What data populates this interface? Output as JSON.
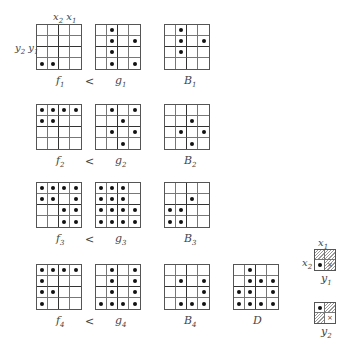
{
  "figure": {
    "axis_labels": {
      "top": "x2 x1",
      "left": "y2 y1"
    },
    "relation_symbol": "<",
    "rows": [
      {
        "f": {
          "label": "f",
          "sub": "1",
          "cells": [
            [
              0,
              0,
              0,
              0
            ],
            [
              0,
              0,
              0,
              0
            ],
            [
              0,
              0,
              0,
              0
            ],
            [
              1,
              1,
              0,
              0
            ]
          ]
        },
        "g": {
          "label": "g",
          "sub": "1",
          "cells": [
            [
              0,
              1,
              0,
              0
            ],
            [
              0,
              1,
              0,
              1
            ],
            [
              0,
              1,
              0,
              0
            ],
            [
              0,
              1,
              0,
              1
            ]
          ]
        },
        "B": {
          "label": "B",
          "sub": "1",
          "cells": [
            [
              0,
              1,
              0,
              0
            ],
            [
              0,
              1,
              0,
              1
            ],
            [
              0,
              1,
              0,
              0
            ],
            [
              0,
              0,
              0,
              0
            ]
          ]
        }
      },
      {
        "f": {
          "label": "f",
          "sub": "2",
          "cells": [
            [
              1,
              1,
              1,
              1
            ],
            [
              1,
              1,
              0,
              0
            ],
            [
              0,
              0,
              0,
              0
            ],
            [
              0,
              0,
              0,
              0
            ]
          ]
        },
        "g": {
          "label": "g",
          "sub": "2",
          "cells": [
            [
              0,
              1,
              0,
              1
            ],
            [
              0,
              0,
              1,
              0
            ],
            [
              0,
              1,
              0,
              1
            ],
            [
              0,
              0,
              1,
              0
            ]
          ]
        },
        "B": {
          "label": "B",
          "sub": "2",
          "cells": [
            [
              0,
              0,
              0,
              0
            ],
            [
              0,
              0,
              1,
              0
            ],
            [
              0,
              1,
              0,
              1
            ],
            [
              0,
              0,
              1,
              0
            ]
          ]
        }
      },
      {
        "f": {
          "label": "f",
          "sub": "3",
          "cells": [
            [
              1,
              1,
              1,
              1
            ],
            [
              1,
              1,
              0,
              1
            ],
            [
              0,
              0,
              1,
              1
            ],
            [
              0,
              0,
              1,
              1
            ]
          ]
        },
        "g": {
          "label": "g",
          "sub": "3",
          "cells": [
            [
              1,
              1,
              1,
              0
            ],
            [
              1,
              1,
              1,
              0
            ],
            [
              1,
              1,
              1,
              1
            ],
            [
              1,
              1,
              1,
              1
            ]
          ]
        },
        "B": {
          "label": "B",
          "sub": "3",
          "cells": [
            [
              0,
              0,
              0,
              0
            ],
            [
              0,
              0,
              1,
              0
            ],
            [
              1,
              1,
              0,
              0
            ],
            [
              1,
              1,
              0,
              0
            ]
          ]
        }
      },
      {
        "f": {
          "label": "f",
          "sub": "4",
          "cells": [
            [
              1,
              1,
              1,
              1
            ],
            [
              1,
              0,
              0,
              0
            ],
            [
              1,
              1,
              0,
              0
            ],
            [
              1,
              0,
              0,
              0
            ]
          ]
        },
        "g": {
          "label": "g",
          "sub": "4",
          "cells": [
            [
              0,
              1,
              0,
              1
            ],
            [
              0,
              1,
              0,
              1
            ],
            [
              0,
              1,
              0,
              1
            ],
            [
              1,
              1,
              1,
              1
            ]
          ]
        },
        "B": {
          "label": "B",
          "sub": "4",
          "cells": [
            [
              0,
              0,
              0,
              0
            ],
            [
              0,
              1,
              0,
              1
            ],
            [
              0,
              0,
              0,
              1
            ],
            [
              0,
              1,
              1,
              1
            ]
          ]
        }
      }
    ],
    "D": {
      "label": "D",
      "sub": "",
      "cells": [
        [
          0,
          1,
          0,
          0
        ],
        [
          0,
          1,
          1,
          1
        ],
        [
          1,
          1,
          0,
          1
        ],
        [
          1,
          1,
          1,
          1
        ]
      ]
    },
    "legend": [
      {
        "name": "y1",
        "top_label": "x1",
        "left_label": "x2",
        "bottom_label": "y",
        "bottom_sub": "1",
        "cells": [
          [
            "hatch",
            ""
          ],
          [
            "dot",
            "x"
          ]
        ],
        "hatched": [
          true,
          true,
          false,
          true
        ]
      },
      {
        "name": "y2",
        "bottom_label": "y",
        "bottom_sub": "2",
        "cells": [
          [
            "dot",
            ""
          ],
          [
            "",
            "x"
          ]
        ],
        "hatched": [
          false,
          true,
          true,
          false
        ]
      }
    ]
  }
}
